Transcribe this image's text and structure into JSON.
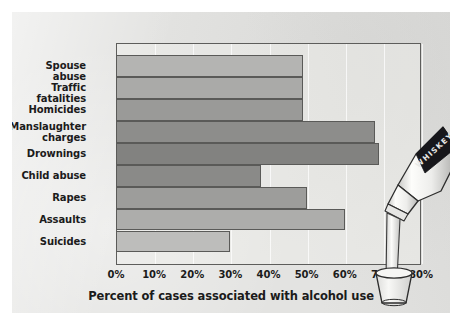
{
  "chart_data": {
    "type": "bar",
    "orientation": "horizontal",
    "title": "",
    "xlabel": "Percent of cases associated with alcohol use",
    "ylabel": "",
    "xlim": [
      0,
      80
    ],
    "xticks": [
      "0%",
      "10%",
      "20%",
      "30%",
      "40%",
      "50%",
      "60%",
      "70%",
      "80%"
    ],
    "xtick_values": [
      0,
      10,
      20,
      30,
      40,
      50,
      60,
      70,
      80
    ],
    "grid": true,
    "legend": "none",
    "categories": [
      "Spouse abuse",
      "Traffic fatalities",
      "Homicides",
      "Manslaughter\ncharges",
      "Drownings",
      "Child abuse",
      "Rapes",
      "Assaults",
      "Suicides"
    ],
    "values": [
      49,
      49,
      49,
      68,
      69,
      38,
      50,
      60,
      30
    ],
    "bar_colors": [
      "#b4b4b2",
      "#aaaaa8",
      "#9a9a98",
      "#8d8d8b",
      "#828280",
      "#8a8a88",
      "#9d9d9b",
      "#adadab",
      "#bdbdbb"
    ]
  },
  "figure": {
    "background_color": "#e3e3e1",
    "frame_color": "#5d5d5b",
    "text_color": "#1b1b1b"
  },
  "illustration": {
    "name": "whiskey-bottle-pouring-into-glass",
    "label_text": "WHISKEY",
    "bottle_color": "#f2f2f0",
    "label_color": "#16161a",
    "glass_color": "#eeeeec"
  }
}
